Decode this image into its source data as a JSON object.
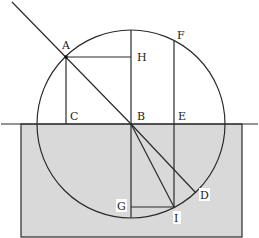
{
  "diagram": {
    "type": "refraction-geometry",
    "colors": {
      "line": "#2a2a2a",
      "water_fill": "#d9d9d9",
      "background": "#ffffff",
      "label_bg": "#ffffff"
    },
    "points": {
      "A": {
        "label": "A",
        "x": 66,
        "y": 57
      },
      "H": {
        "label": "H",
        "x": 131,
        "y": 57
      },
      "F": {
        "label": "F",
        "x": 174,
        "y": 41
      },
      "C": {
        "label": "C",
        "x": 66,
        "y": 124
      },
      "B": {
        "label": "B",
        "x": 131,
        "y": 124
      },
      "E": {
        "label": "E",
        "x": 174,
        "y": 124
      },
      "G": {
        "label": "G",
        "x": 131,
        "y": 207
      },
      "I": {
        "label": "I",
        "x": 174,
        "y": 207
      },
      "D": {
        "label": "D",
        "x": 196,
        "y": 193
      }
    },
    "labels": [
      "A",
      "H",
      "F",
      "C",
      "B",
      "E",
      "G",
      "I",
      "D"
    ]
  }
}
